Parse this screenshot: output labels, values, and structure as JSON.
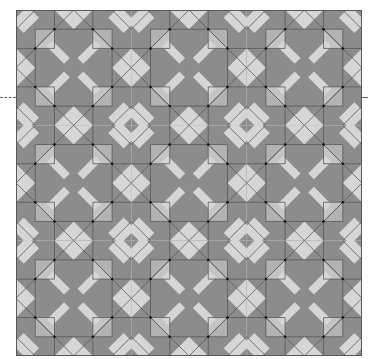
{
  "figure": {
    "grid": {
      "columns": 3,
      "rows": 3,
      "unit_px": 115.33
    },
    "colors": {
      "dark": "#8c8c8c",
      "mid": "#b3b3b3",
      "light": "#d6d6d6",
      "line": "#555555",
      "dot": "#111111",
      "background": "#ffffff"
    },
    "marker": {
      "type": "dashed-guide-line",
      "y": 97
    }
  }
}
